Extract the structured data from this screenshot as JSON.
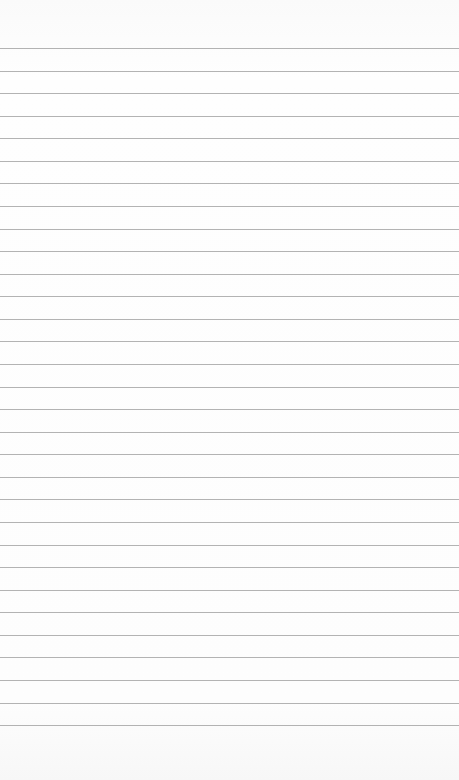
{
  "paper": {
    "type": "lined-paper",
    "background": "#fdfdfd",
    "line_color": "#9a9a9a",
    "first_line_y": 48,
    "line_spacing": 22.57,
    "line_count": 31
  }
}
